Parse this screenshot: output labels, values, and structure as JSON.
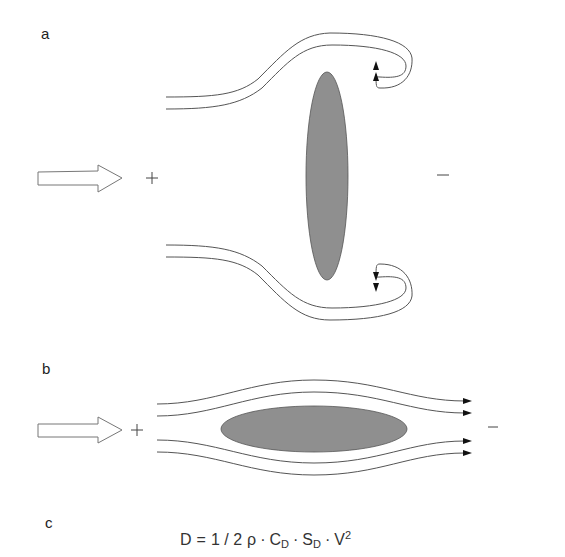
{
  "panels": {
    "a": {
      "label": "a",
      "high_pressure_sign": "+",
      "low_pressure_sign": "−",
      "description": "Flow around a flat plate perpendicular to the flow with vortex shedding"
    },
    "b": {
      "label": "b",
      "high_pressure_sign": "+",
      "low_pressure_sign": "−",
      "description": "Streamlined flow around an elongated body parallel to the flow"
    },
    "c": {
      "label": "c",
      "equation": {
        "lhs": "D",
        "equals": "=",
        "factor": "1 / 2",
        "rho": "ρ",
        "dot": "·",
        "cd": "C",
        "cd_sub": "D",
        "sd": "S",
        "sd_sub": "D",
        "v": "V",
        "v_sup": "2"
      }
    }
  },
  "colors": {
    "body_fill": "#8f8f8f",
    "line": "#555555",
    "arrow_outline": "#777777",
    "background": "#ffffff"
  }
}
